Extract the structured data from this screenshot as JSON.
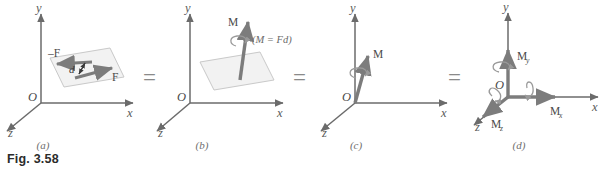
{
  "figure": {
    "caption": "Fig. 3.58",
    "equals_signs": [
      "=",
      "=",
      "="
    ]
  },
  "axes": {
    "x_label": "x",
    "y_label": "y",
    "z_label": "z",
    "origin_label": "O"
  },
  "panels": [
    {
      "id": "a",
      "label": "(a)",
      "description": "couple of two equal opposite forces on a plane",
      "annotations": {
        "force_positive": "F",
        "force_negative": "–F",
        "distance": "d"
      }
    },
    {
      "id": "b",
      "label": "(b)",
      "description": "equivalent moment vector on the plane",
      "annotations": {
        "moment": "M",
        "relation": "(M = Fd)"
      }
    },
    {
      "id": "c",
      "label": "(c)",
      "description": "free moment vector at origin",
      "annotations": {
        "moment": "M"
      }
    },
    {
      "id": "d",
      "label": "(d)",
      "description": "moment resolved into rectangular components",
      "annotations": {
        "moment_x": "M",
        "moment_x_sub": "x",
        "moment_y": "M",
        "moment_y_sub": "y",
        "moment_z": "M",
        "moment_z_sub": "z"
      }
    }
  ],
  "colors": {
    "axis": "#6b6b6b",
    "vector": "#7c7c7c",
    "plane_fill": "#f2f2f2",
    "plane_stroke": "#c9c9c9",
    "text": "#4a4a4a",
    "caption": "#2b2b2b",
    "background": "#ffffff"
  }
}
